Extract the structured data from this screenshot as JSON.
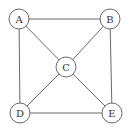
{
  "diagram": {
    "type": "graph",
    "nodes": [
      {
        "id": "A",
        "label": "A",
        "x": 19,
        "y": 19
      },
      {
        "id": "B",
        "label": "B",
        "x": 110,
        "y": 19
      },
      {
        "id": "C",
        "label": "C",
        "x": 66,
        "y": 67
      },
      {
        "id": "D",
        "label": "D",
        "x": 20,
        "y": 113
      },
      {
        "id": "E",
        "label": "E",
        "x": 112,
        "y": 113
      }
    ],
    "edges": [
      {
        "from": "A",
        "to": "B"
      },
      {
        "from": "A",
        "to": "D"
      },
      {
        "from": "A",
        "to": "C"
      },
      {
        "from": "B",
        "to": "C"
      },
      {
        "from": "B",
        "to": "E"
      },
      {
        "from": "C",
        "to": "D"
      },
      {
        "from": "C",
        "to": "E"
      },
      {
        "from": "D",
        "to": "E"
      }
    ],
    "node_radius": 10,
    "colors": {
      "stroke": "#6a6a6a",
      "fill": "#ffffff",
      "text": "#333333"
    }
  }
}
